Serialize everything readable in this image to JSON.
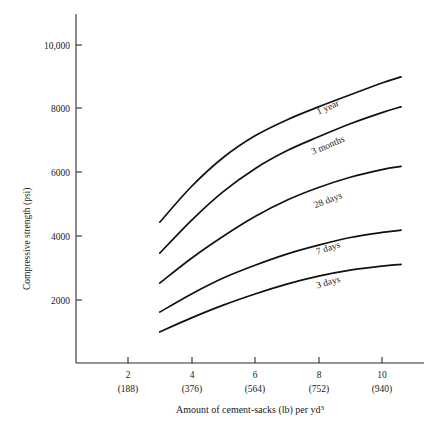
{
  "chart_data": {
    "type": "line",
    "title": "",
    "xlabel": "Amount of cement-sacks (lb) per yd3",
    "ylabel": "Compressive strength (psi)",
    "xlim": [
      0.6,
      11.3
    ],
    "ylim": [
      0,
      11200
    ],
    "grid": false,
    "legend_position": "inline-curve-labels",
    "x_ticks": [
      2,
      4,
      6,
      8,
      10
    ],
    "x_tick_labels": [
      "2",
      "4",
      "6",
      "8",
      "10"
    ],
    "x_tick_sublabels": [
      "(188)",
      "(376)",
      "(564)",
      "(752)",
      "(940)"
    ],
    "y_ticks": [
      2000,
      4000,
      6000,
      8000,
      10000
    ],
    "y_tick_labels": [
      "2000",
      "4000",
      "6000",
      "8000",
      "10,000"
    ],
    "series": [
      {
        "name": "1 year",
        "label": "1 year",
        "x": [
          3.0,
          4.0,
          5.0,
          6.0,
          7.0,
          8.0,
          9.0,
          10.0,
          10.6
        ],
        "values": [
          4440,
          5560,
          6470,
          7150,
          7650,
          8060,
          8440,
          8810,
          9000
        ]
      },
      {
        "name": "3 months",
        "label": "3 months",
        "x": [
          3.0,
          4.0,
          5.0,
          6.0,
          7.0,
          8.0,
          9.0,
          10.0,
          10.6
        ],
        "values": [
          3470,
          4500,
          5400,
          6120,
          6680,
          7120,
          7530,
          7880,
          8060
        ]
      },
      {
        "name": "28 days",
        "label": "28 days",
        "x": [
          3.0,
          4.0,
          5.0,
          6.0,
          7.0,
          8.0,
          9.0,
          10.0,
          10.6
        ],
        "values": [
          2530,
          3310,
          4000,
          4620,
          5130,
          5530,
          5850,
          6090,
          6190
        ]
      },
      {
        "name": "7 days",
        "label": "7 days",
        "x": [
          3.0,
          4.0,
          5.0,
          6.0,
          7.0,
          8.0,
          9.0,
          10.0,
          10.6
        ],
        "values": [
          1620,
          2190,
          2690,
          3090,
          3440,
          3720,
          3960,
          4120,
          4190
        ]
      },
      {
        "name": "3 days",
        "label": "3 days",
        "x": [
          3.0,
          4.0,
          5.0,
          6.0,
          7.0,
          8.0,
          9.0,
          10.0,
          10.6
        ],
        "values": [
          1000,
          1440,
          1840,
          2190,
          2500,
          2750,
          2940,
          3060,
          3120
        ]
      }
    ]
  }
}
